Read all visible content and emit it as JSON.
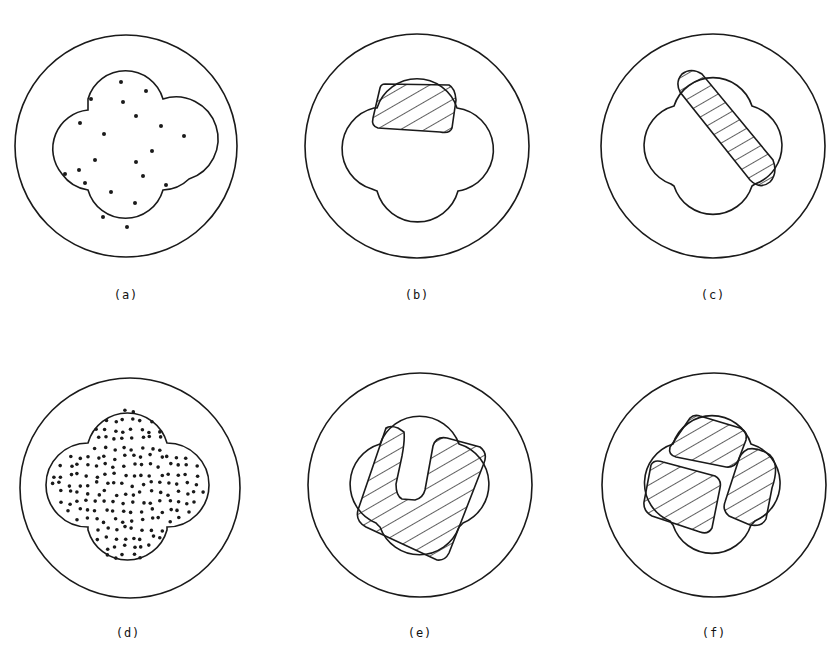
{
  "figure": {
    "stroke_color": "#1a1a1a",
    "panels": [
      {
        "id": "a",
        "label": "(a)",
        "fill": "sparse-dots",
        "description": "Quatrefoil cross-section with sparse dot distribution inside circle"
      },
      {
        "id": "b",
        "label": "(b)",
        "fill": "single-hatched-block-top",
        "description": "Quatrefoil with single hatched block in top lobe"
      },
      {
        "id": "c",
        "label": "(c)",
        "fill": "diagonal-hatched-bar",
        "description": "Quatrefoil with diagonal hatched elongated bar"
      },
      {
        "id": "d",
        "label": "(d)",
        "fill": "dense-dots",
        "description": "Quatrefoil cross-section with dense dot distribution"
      },
      {
        "id": "e",
        "label": "(e)",
        "fill": "u-shaped-hatched-block",
        "description": "Quatrefoil with U-shaped hatched block"
      },
      {
        "id": "f",
        "label": "(f)",
        "fill": "three-hatched-blocks",
        "description": "Quatrefoil with three hatched blocks"
      }
    ]
  }
}
